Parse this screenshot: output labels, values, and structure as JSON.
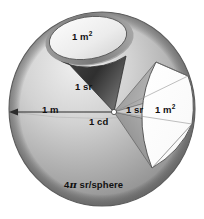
{
  "figure": {
    "labels": {
      "cone_cap_area": "1 m",
      "cone_cap_area_sup": "2",
      "cone_solid_angle": "1 sr",
      "radius": "1 m",
      "center_intensity": "1 cd",
      "wedge_solid_angle": "1 sr",
      "wedge_area": "1 m",
      "wedge_area_sup": "2",
      "sphere_total": "4π sr/sphere",
      "sphere_total_prefix": "4",
      "sphere_total_pi": "π",
      "sphere_total_suffix": "sr/sphere"
    },
    "colors": {
      "sphere_light": "#e3e3e3",
      "sphere_mid": "#b4b4b4",
      "sphere_dark": "#8e8e8e",
      "cone_dark": "#4a4a4a",
      "cap_fill": "#efefef",
      "patch_fill": "#ffffff",
      "outline": "#3a3a3a",
      "text": "#111111",
      "background": "#ffffff"
    },
    "geometry": {
      "sphere_center_x": 102,
      "sphere_center_y": 109,
      "sphere_radius_x": 93,
      "sphere_radius_y": 97,
      "apex_x": 114,
      "apex_y": 112
    }
  }
}
